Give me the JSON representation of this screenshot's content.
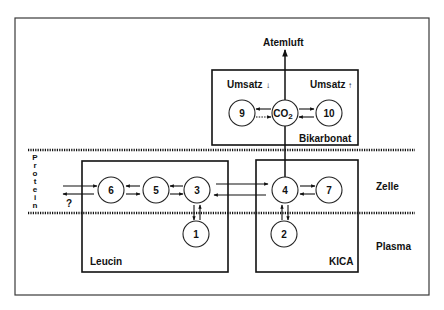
{
  "diagram": {
    "type": "compartment-model",
    "labels": {
      "exhaled_air": "Atemluft",
      "turnover_down": "Umsatz",
      "turnover_up": "Umsatz",
      "turnover_down_arrow": "↓",
      "turnover_up_arrow": "↑",
      "bicarbonate": "Bikarbonat",
      "protein_letters": [
        "P",
        "r",
        "o",
        "t",
        "e",
        "i",
        "n"
      ],
      "question": "?",
      "cell": "Zelle",
      "plasma": "Plasma",
      "leucine": "Leucin",
      "kica": "KICA"
    },
    "nodes": {
      "n9": "9",
      "co2": "CO",
      "co2_sub": "2",
      "n10": "10",
      "n6": "6",
      "n5": "5",
      "n3": "3",
      "n4": "4",
      "n7": "7",
      "n1": "1",
      "n2": "2"
    },
    "compartments": [
      "Bikarbonat",
      "Leucin",
      "KICA"
    ],
    "regions": [
      "Zelle",
      "Plasma"
    ],
    "edges": [
      {
        "from": "CO2",
        "to": "Atemluft",
        "style": "solid",
        "direction": "one-way"
      },
      {
        "from": "CO2",
        "to": "9",
        "style": "solid"
      },
      {
        "from": "9",
        "to": "CO2",
        "style": "dotted"
      },
      {
        "from": "CO2",
        "to": "10",
        "style": "solid"
      },
      {
        "from": "10",
        "to": "CO2",
        "style": "solid"
      },
      {
        "from": "4",
        "to": "CO2",
        "style": "solid",
        "direction": "one-way"
      },
      {
        "from": "Protein",
        "to": "6",
        "style": "solid"
      },
      {
        "from": "6",
        "to": "Protein",
        "style": "solid",
        "note": "?"
      },
      {
        "from": "6",
        "to": "5",
        "style": "solid"
      },
      {
        "from": "5",
        "to": "6",
        "style": "solid"
      },
      {
        "from": "5",
        "to": "3",
        "style": "solid"
      },
      {
        "from": "3",
        "to": "5",
        "style": "solid"
      },
      {
        "from": "3",
        "to": "4",
        "style": "solid"
      },
      {
        "from": "4",
        "to": "3",
        "style": "solid"
      },
      {
        "from": "4",
        "to": "7",
        "style": "solid"
      },
      {
        "from": "7",
        "to": "4",
        "style": "solid"
      },
      {
        "from": "1",
        "to": "3",
        "style": "solid"
      },
      {
        "from": "3",
        "to": "1",
        "style": "solid"
      },
      {
        "from": "2",
        "to": "4",
        "style": "solid"
      },
      {
        "from": "4",
        "to": "2",
        "style": "solid"
      }
    ]
  }
}
